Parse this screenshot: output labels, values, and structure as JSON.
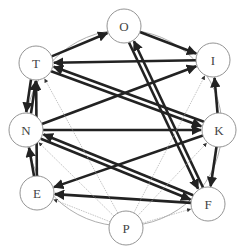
{
  "diagram": {
    "type": "directed-graph",
    "layout": "circular",
    "colors": {
      "thick_edge": "#222222",
      "thin_edge": "#aaaaaa",
      "node_stroke": "#888888",
      "ring": "#999999",
      "label": "#444444"
    },
    "nodes": [
      {
        "id": "O",
        "label": "O",
        "x": 124,
        "y": 26
      },
      {
        "id": "I",
        "label": "I",
        "x": 213,
        "y": 60
      },
      {
        "id": "K",
        "label": "K",
        "x": 219,
        "y": 130
      },
      {
        "id": "F",
        "label": "F",
        "x": 208,
        "y": 204
      },
      {
        "id": "P",
        "label": "P",
        "x": 126,
        "y": 228
      },
      {
        "id": "E",
        "label": "E",
        "x": 37,
        "y": 193
      },
      {
        "id": "N",
        "label": "N",
        "x": 26,
        "y": 130
      },
      {
        "id": "T",
        "label": "T",
        "x": 36,
        "y": 63
      }
    ],
    "edges": [
      {
        "from": "T",
        "to": "O",
        "weight": "thick"
      },
      {
        "from": "O",
        "to": "I",
        "weight": "thick"
      },
      {
        "from": "I",
        "to": "T",
        "weight": "thick"
      },
      {
        "from": "T",
        "to": "N",
        "weight": "thick"
      },
      {
        "from": "N",
        "to": "T",
        "weight": "thick"
      },
      {
        "from": "E",
        "to": "T",
        "weight": "thick"
      },
      {
        "from": "K",
        "to": "T",
        "weight": "thick"
      },
      {
        "from": "N",
        "to": "I",
        "weight": "thick"
      },
      {
        "from": "N",
        "to": "K",
        "weight": "thick"
      },
      {
        "from": "T",
        "to": "K",
        "weight": "thick"
      },
      {
        "from": "E",
        "to": "N",
        "weight": "thick"
      },
      {
        "from": "F",
        "to": "N",
        "weight": "thick"
      },
      {
        "from": "K",
        "to": "E",
        "weight": "thick"
      },
      {
        "from": "F",
        "to": "E",
        "weight": "thick"
      },
      {
        "from": "K",
        "to": "I",
        "weight": "thick"
      },
      {
        "from": "K",
        "to": "F",
        "weight": "thick"
      },
      {
        "from": "F",
        "to": "O",
        "weight": "thick"
      },
      {
        "from": "O",
        "to": "F",
        "weight": "thick"
      },
      {
        "from": "N",
        "to": "F",
        "weight": "thick"
      },
      {
        "from": "P",
        "to": "T",
        "weight": "thin"
      },
      {
        "from": "P",
        "to": "N",
        "weight": "thin"
      },
      {
        "from": "P",
        "to": "E",
        "weight": "thin"
      },
      {
        "from": "P",
        "to": "I",
        "weight": "thin"
      },
      {
        "from": "P",
        "to": "K",
        "weight": "thin"
      },
      {
        "from": "P",
        "to": "F",
        "weight": "thin"
      }
    ]
  }
}
